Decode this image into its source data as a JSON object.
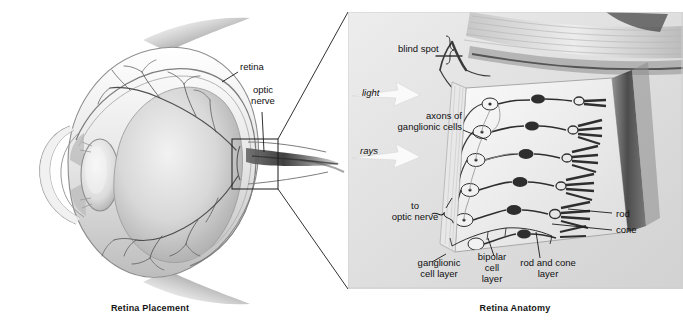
{
  "figure": {
    "title_left": "Retina Placement",
    "title_right": "Retina Anatomy"
  },
  "left_panel": {
    "name": "Retina Placement",
    "caption": "Retina Placement",
    "labels": [
      {
        "id": "retina",
        "text": "retina",
        "x": 240,
        "y": 66
      },
      {
        "id": "optic-nerve",
        "text": "optic\nnerve",
        "line1": "optic",
        "line2": "nerve",
        "x": 242,
        "y": 88
      }
    ],
    "inset_box": {
      "x": 232,
      "y": 139,
      "width": 46,
      "height": 50
    },
    "structures": [
      "cornea",
      "iris",
      "lens",
      "sclera",
      "choroid",
      "retina",
      "retinal blood vessels",
      "optic nerve",
      "extraocular muscle"
    ]
  },
  "right_panel": {
    "name": "Retina Anatomy",
    "caption": "Retina Anatomy",
    "frame": {
      "x": 348,
      "y": 12,
      "width": 335,
      "height": 277
    },
    "labels": [
      {
        "id": "blind-spot",
        "text": "blind spot",
        "x": 400,
        "y": 48
      },
      {
        "id": "light",
        "text": "light",
        "x": 362,
        "y": 90
      },
      {
        "id": "axons-of-ganglionic-cells",
        "line1": "axons of",
        "line2": "ganglionic cells",
        "x": 369,
        "y": 112
      },
      {
        "id": "rays",
        "text": "rays",
        "x": 361,
        "y": 148
      },
      {
        "id": "to-optic-nerve",
        "line1": "to",
        "line2": "optic nerve",
        "x": 392,
        "y": 203
      },
      {
        "id": "rod",
        "text": "rod",
        "x": 618,
        "y": 213
      },
      {
        "id": "cone",
        "text": "cone",
        "x": 618,
        "y": 228
      },
      {
        "id": "ganglionic-cell-layer",
        "line1": "ganglionic",
        "line2": "cell layer",
        "x": 412,
        "y": 259
      },
      {
        "id": "bipolar-cell-layer",
        "line1": "bipolar",
        "line2": "cell",
        "line3": "layer",
        "x": 472,
        "y": 254
      },
      {
        "id": "rod-and-cone-layer",
        "line1": "rod and cone",
        "line2": "layer",
        "x": 514,
        "y": 259
      }
    ],
    "cell_layers": [
      "ganglionic cell layer",
      "bipolar cell layer",
      "rod and cone layer"
    ],
    "arrows": [
      {
        "id": "light-arrow",
        "label": "light"
      },
      {
        "id": "rays-arrow",
        "label": "rays"
      }
    ]
  },
  "connectors": {
    "description": "magnification leader lines from inset box to detail panel",
    "lines": [
      {
        "from_x": 278,
        "from_y": 139,
        "to_x": 348,
        "to_y": 12
      },
      {
        "from_x": 278,
        "from_y": 189,
        "to_x": 348,
        "to_y": 289
      }
    ]
  },
  "colors": {
    "ink": "#101010",
    "panel_bg": "#e3e3e3",
    "paper": "#ffffff",
    "mid_grey": "#9a9a9a",
    "dark_grey": "#4a4a4a"
  }
}
